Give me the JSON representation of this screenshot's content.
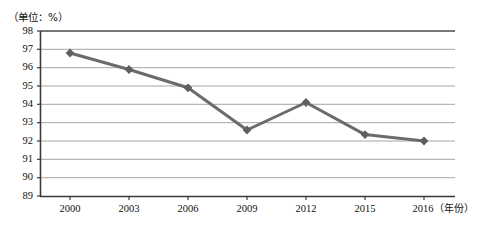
{
  "chart_data": {
    "type": "line",
    "title": "",
    "subtitle": "",
    "unit_note": "（单位：%）",
    "xlabel": "（年份）",
    "ylabel": "",
    "categories": [
      "2000",
      "2003",
      "2006",
      "2009",
      "2012",
      "2015",
      "2016"
    ],
    "values": [
      96.8,
      95.9,
      94.9,
      92.6,
      94.1,
      92.35,
      92.0
    ],
    "series": [
      {
        "name": "",
        "values": [
          96.8,
          95.9,
          94.9,
          92.6,
          94.1,
          92.35,
          92.0
        ]
      }
    ],
    "ylim": [
      89,
      98
    ],
    "yticks": [
      89,
      90,
      91,
      92,
      93,
      94,
      95,
      96,
      97,
      98
    ],
    "ytick_labels": [
      "89",
      "90",
      "91",
      "92",
      "93",
      "94",
      "95",
      "96",
      "97",
      "98"
    ],
    "xtick_labels": [
      "2000",
      "2003",
      "2006",
      "2009",
      "2012",
      "2015",
      "2016"
    ],
    "grid": true,
    "grid_axis": "y",
    "legend": "none",
    "marker": "diamond",
    "colors": {
      "line": "#6b6b6b",
      "marker": "#5f5f5f",
      "grid": "#9a9a9a",
      "axis": "#3a3a3a",
      "text": "#111111",
      "background": "#ffffff"
    }
  },
  "axis": {
    "y_labels": [
      "98",
      "97",
      "96",
      "95",
      "94",
      "93",
      "92",
      "91",
      "90",
      "89"
    ],
    "x_labels": [
      "2000",
      "2003",
      "2006",
      "2009",
      "2012",
      "2015"
    ],
    "x_last_label": "2016",
    "x_unit": "（年份）"
  }
}
